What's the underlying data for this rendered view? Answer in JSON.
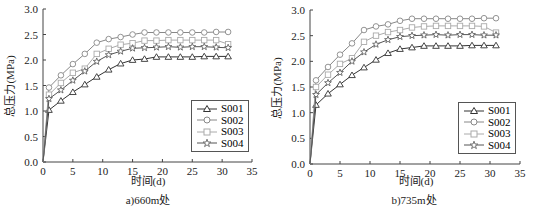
{
  "chart_data": [
    {
      "type": "line",
      "title": "",
      "caption": "a)660m处",
      "xlabel": "时间(d)",
      "ylabel": "总压力(MPa)",
      "xlim": [
        0,
        35
      ],
      "ylim": [
        0,
        3.0
      ],
      "xticks": [
        0,
        5,
        10,
        15,
        20,
        25,
        30,
        35
      ],
      "yticks": [
        "0.0",
        "0.5",
        "1.0",
        "1.5",
        "2.0",
        "2.5",
        "3.0"
      ],
      "grid": false,
      "legend_position": "lower right",
      "x": [
        0,
        1,
        3,
        5,
        7,
        9,
        11,
        13,
        15,
        17,
        19,
        21,
        23,
        25,
        27,
        29,
        31
      ],
      "series": [
        {
          "name": "S001",
          "marker": "triangle",
          "color": "#333333",
          "values": [
            0,
            1.02,
            1.2,
            1.37,
            1.52,
            1.67,
            1.81,
            1.93,
            2.0,
            2.02,
            2.06,
            2.06,
            2.06,
            2.06,
            2.07,
            2.07,
            2.07
          ]
        },
        {
          "name": "S002",
          "marker": "circle",
          "color": "#888888",
          "values": [
            0,
            1.46,
            1.7,
            1.92,
            2.12,
            2.34,
            2.41,
            2.45,
            2.5,
            2.54,
            2.54,
            2.54,
            2.54,
            2.54,
            2.54,
            2.55,
            2.55
          ]
        },
        {
          "name": "S003",
          "marker": "square",
          "color": "#aaaaaa",
          "values": [
            0,
            1.32,
            1.55,
            1.75,
            1.83,
            2.12,
            2.22,
            2.3,
            2.33,
            2.38,
            2.38,
            2.39,
            2.39,
            2.39,
            2.39,
            2.39,
            2.31
          ]
        },
        {
          "name": "S004",
          "marker": "star",
          "color": "#555555",
          "values": [
            0,
            1.24,
            1.41,
            1.6,
            1.78,
            1.97,
            2.1,
            2.17,
            2.23,
            2.24,
            2.25,
            2.26,
            2.25,
            2.26,
            2.26,
            2.25,
            2.24
          ]
        }
      ]
    },
    {
      "type": "line",
      "title": "",
      "caption": "b)735m处",
      "xlabel": "时间(d)",
      "ylabel": "总压力(MPa)",
      "xlim": [
        0,
        35
      ],
      "ylim": [
        0,
        3.0
      ],
      "xticks": [
        0,
        5,
        10,
        15,
        20,
        25,
        30,
        35
      ],
      "yticks": [
        "0.0",
        "0.5",
        "1.0",
        "1.5",
        "2.0",
        "2.5",
        "3.0"
      ],
      "grid": false,
      "legend_position": "lower right",
      "x": [
        0,
        1,
        3,
        5,
        7,
        9,
        11,
        13,
        15,
        17,
        19,
        21,
        23,
        25,
        27,
        29,
        31
      ],
      "series": [
        {
          "name": "S001",
          "marker": "triangle",
          "color": "#333333",
          "values": [
            0,
            1.15,
            1.37,
            1.55,
            1.73,
            1.88,
            2.03,
            2.16,
            2.24,
            2.27,
            2.3,
            2.3,
            2.3,
            2.3,
            2.31,
            2.31,
            2.31
          ]
        },
        {
          "name": "S002",
          "marker": "circle",
          "color": "#888888",
          "values": [
            0,
            1.63,
            1.89,
            2.13,
            2.35,
            2.61,
            2.68,
            2.72,
            2.79,
            2.83,
            2.83,
            2.83,
            2.83,
            2.83,
            2.83,
            2.84,
            2.84
          ]
        },
        {
          "name": "S003",
          "marker": "square",
          "color": "#aaaaaa",
          "values": [
            0,
            1.5,
            1.74,
            1.95,
            2.06,
            2.38,
            2.5,
            2.57,
            2.61,
            2.66,
            2.68,
            2.69,
            2.69,
            2.69,
            2.69,
            2.68,
            2.56
          ]
        },
        {
          "name": "S004",
          "marker": "star",
          "color": "#555555",
          "values": [
            0,
            1.35,
            1.58,
            1.78,
            2.0,
            2.18,
            2.33,
            2.42,
            2.48,
            2.5,
            2.51,
            2.52,
            2.51,
            2.52,
            2.52,
            2.51,
            2.51
          ]
        }
      ]
    }
  ],
  "panels": [
    {
      "caption": "a)660m处",
      "xlabel": "时间(d)",
      "ylabel": "总压力(MPa)",
      "legend": [
        "S001",
        "S002",
        "S003",
        "S004"
      ]
    },
    {
      "caption": "b)735m处",
      "xlabel": "时间(d)",
      "ylabel": "总压力(MPa)",
      "legend": [
        "S001",
        "S002",
        "S003",
        "S004"
      ]
    }
  ]
}
